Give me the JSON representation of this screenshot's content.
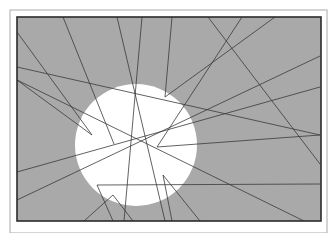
{
  "canvas": {
    "width": 335,
    "height": 233,
    "background": "#ffffff"
  },
  "outer_frame": {
    "x": 10,
    "y": 10,
    "width": 317,
    "height": 223,
    "stroke": "#b8b8b8",
    "stroke_width": 1.2
  },
  "inner_frame": {
    "x": 17,
    "y": 17,
    "width": 304,
    "height": 204,
    "fill": "#a9a9a9",
    "stroke": "#2b2b2b",
    "stroke_width": 1.6
  },
  "sun": {
    "cx": 136,
    "cy": 145,
    "r": 61,
    "fill": "#ffffff"
  },
  "line_style": {
    "stroke": "#3a3a3a",
    "stroke_width": 0.8
  },
  "lines": [
    {
      "points": "17,32 92,135 17,80"
    },
    {
      "points": "63,17 114,144"
    },
    {
      "points": "17,67 320,135"
    },
    {
      "points": "117,17 165,221"
    },
    {
      "points": "142,17 124,221"
    },
    {
      "points": "172,17 165,97 275,17"
    },
    {
      "points": "208,17 320,164"
    },
    {
      "points": "242,17 157,147 320,135"
    },
    {
      "points": "320,56 17,200"
    },
    {
      "points": "320,87 17,172"
    },
    {
      "points": "320,184 97,185 113,221"
    },
    {
      "points": "113,195 84,221"
    },
    {
      "points": "113,195 133,221"
    },
    {
      "points": "163,175 200,221"
    },
    {
      "points": "163,175 172,221"
    },
    {
      "points": "17,80 304,221"
    }
  ]
}
